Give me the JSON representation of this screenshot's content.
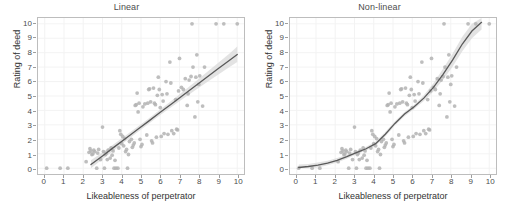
{
  "figure": {
    "background": "#ffffff",
    "point_color": "#b3b3b3",
    "line_color": "#595959",
    "ribbon_color": "#d9d9d9",
    "panel_border_color": "#bdbdbd",
    "grid_color": "#f2f2f2"
  },
  "chart_data": [
    {
      "type": "scatter",
      "title": "Linear",
      "xlabel": "Likeableness of perpetrator",
      "ylabel": "Rating of deed",
      "xlim": [
        -0.35,
        10.35
      ],
      "ylim": [
        -0.4,
        10.4
      ],
      "xticks": [
        0,
        1,
        2,
        3,
        4,
        5,
        6,
        7,
        8,
        9,
        10
      ],
      "yticks": [
        0,
        1,
        2,
        3,
        4,
        5,
        6,
        7,
        8,
        9,
        10
      ],
      "grid": true,
      "legend": "none",
      "fit": {
        "kind": "linear",
        "label": "linear regression with 95% confidence band",
        "x": [
          2.4,
          3.0,
          3.6,
          4.2,
          4.8,
          5.4,
          6.0,
          6.6,
          7.2,
          7.8,
          8.4,
          9.0,
          9.6,
          10.0
        ],
        "y": [
          0.25,
          0.85,
          1.46,
          2.06,
          2.66,
          3.26,
          3.87,
          4.47,
          5.07,
          5.67,
          6.28,
          6.88,
          7.48,
          7.88
        ],
        "ci_lower": [
          0.0,
          0.62,
          1.25,
          1.86,
          2.47,
          3.08,
          3.68,
          4.26,
          4.82,
          5.38,
          5.93,
          6.47,
          7.0,
          7.35
        ],
        "ci_upper": [
          0.55,
          1.1,
          1.68,
          2.27,
          2.86,
          3.45,
          4.06,
          4.69,
          5.33,
          5.97,
          6.62,
          7.28,
          7.95,
          8.42
        ]
      },
      "points": [
        [
          0.1,
          0
        ],
        [
          0.8,
          0
        ],
        [
          1.2,
          0
        ],
        [
          2.15,
          0.45
        ],
        [
          2.3,
          1.1
        ],
        [
          2.35,
          1.35
        ],
        [
          2.4,
          1.2
        ],
        [
          2.45,
          0.95
        ],
        [
          2.5,
          1.0
        ],
        [
          2.55,
          1.25
        ],
        [
          2.6,
          1.15
        ],
        [
          2.7,
          0
        ],
        [
          2.75,
          1.05
        ],
        [
          2.8,
          1.3
        ],
        [
          2.9,
          0.6
        ],
        [
          3.0,
          2.85
        ],
        [
          3.05,
          1.15
        ],
        [
          3.1,
          0
        ],
        [
          3.15,
          0.95
        ],
        [
          3.2,
          1.05
        ],
        [
          3.25,
          0.6
        ],
        [
          3.3,
          1.25
        ],
        [
          3.4,
          0.7
        ],
        [
          3.45,
          1.4
        ],
        [
          3.5,
          0.9
        ],
        [
          3.55,
          1.2
        ],
        [
          3.6,
          0
        ],
        [
          3.65,
          0.55
        ],
        [
          3.7,
          0
        ],
        [
          3.8,
          0
        ],
        [
          3.85,
          1.4
        ],
        [
          3.9,
          2.6
        ],
        [
          3.95,
          2.35
        ],
        [
          4.0,
          1.7
        ],
        [
          4.05,
          2.2
        ],
        [
          4.1,
          1.55
        ],
        [
          4.15,
          2.05
        ],
        [
          4.2,
          1.15
        ],
        [
          4.25,
          1.3
        ],
        [
          4.3,
          0
        ],
        [
          4.35,
          0.95
        ],
        [
          4.4,
          1.85
        ],
        [
          4.5,
          2.0
        ],
        [
          4.55,
          1.45
        ],
        [
          4.6,
          1.6
        ],
        [
          4.65,
          1.75
        ],
        [
          4.7,
          4.35
        ],
        [
          4.75,
          4.4
        ],
        [
          4.8,
          5.2
        ],
        [
          4.85,
          3.9
        ],
        [
          4.9,
          4.5
        ],
        [
          4.95,
          2.0
        ],
        [
          5.0,
          1.5
        ],
        [
          5.05,
          1.65
        ],
        [
          5.1,
          4.25
        ],
        [
          5.2,
          4.45
        ],
        [
          5.3,
          2.3
        ],
        [
          5.35,
          4.5
        ],
        [
          5.4,
          5.45
        ],
        [
          5.45,
          5.5
        ],
        [
          5.5,
          4.6
        ],
        [
          5.55,
          1.9
        ],
        [
          5.6,
          1.75
        ],
        [
          5.65,
          5.55
        ],
        [
          5.7,
          4.5
        ],
        [
          5.75,
          4.4
        ],
        [
          5.8,
          2.15
        ],
        [
          5.85,
          5.05
        ],
        [
          5.9,
          6.3
        ],
        [
          5.95,
          5.45
        ],
        [
          6.0,
          4.2
        ],
        [
          6.05,
          2.2
        ],
        [
          6.1,
          5.1
        ],
        [
          6.15,
          4.65
        ],
        [
          6.2,
          2.4
        ],
        [
          6.3,
          6.0
        ],
        [
          6.35,
          5.15
        ],
        [
          6.4,
          2.35
        ],
        [
          6.5,
          7.35
        ],
        [
          6.55,
          5.9
        ],
        [
          6.6,
          2.6
        ],
        [
          6.7,
          2.4
        ],
        [
          6.8,
          4.75
        ],
        [
          6.85,
          2.7
        ],
        [
          6.9,
          2.65
        ],
        [
          6.95,
          5.35
        ],
        [
          7.0,
          7.6
        ],
        [
          7.1,
          5.6
        ],
        [
          7.2,
          5.45
        ],
        [
          7.3,
          6.2
        ],
        [
          7.4,
          4.35
        ],
        [
          7.45,
          5.15
        ],
        [
          7.5,
          6.1
        ],
        [
          7.6,
          6.35
        ],
        [
          7.65,
          10
        ],
        [
          7.7,
          7.0
        ],
        [
          7.8,
          3.55
        ],
        [
          7.85,
          6.3
        ],
        [
          7.9,
          7.85
        ],
        [
          7.95,
          4.6
        ],
        [
          8.0,
          5.8
        ],
        [
          8.05,
          6.4
        ],
        [
          8.2,
          4.3
        ],
        [
          8.3,
          7.0
        ],
        [
          8.9,
          10
        ],
        [
          9.3,
          10
        ],
        [
          10.0,
          10
        ]
      ]
    },
    {
      "type": "scatter",
      "title": "Non-linear",
      "xlabel": "Likeableness of perpetrator",
      "ylabel": "Rating of deed",
      "xlim": [
        -0.35,
        10.35
      ],
      "ylim": [
        -0.4,
        10.4
      ],
      "xticks": [
        0,
        1,
        2,
        3,
        4,
        5,
        6,
        7,
        8,
        9,
        10
      ],
      "yticks": [
        0,
        1,
        2,
        3,
        4,
        5,
        6,
        7,
        8,
        9,
        10
      ],
      "grid": true,
      "legend": "none",
      "fit": {
        "kind": "curve",
        "label": "non-linear (polynomial) fit with 95% confidence band",
        "x": [
          0.1,
          0.6,
          1.1,
          1.6,
          2.1,
          2.6,
          3.1,
          3.6,
          4.1,
          4.6,
          5.1,
          5.6,
          6.1,
          6.6,
          7.1,
          7.6,
          8.1,
          8.6,
          9.1,
          9.6
        ],
        "y": [
          0.05,
          0.12,
          0.22,
          0.36,
          0.55,
          0.8,
          1.08,
          1.35,
          1.7,
          2.35,
          3.1,
          3.75,
          4.25,
          4.85,
          5.6,
          6.5,
          7.5,
          8.6,
          9.5,
          10.1
        ],
        "ci_lower": [
          0.0,
          0.0,
          0.05,
          0.2,
          0.4,
          0.66,
          0.96,
          1.22,
          1.55,
          2.2,
          2.95,
          3.6,
          4.1,
          4.65,
          5.32,
          6.12,
          7.05,
          8.1,
          9.0,
          9.6
        ],
        "ci_upper": [
          0.25,
          0.3,
          0.4,
          0.52,
          0.7,
          0.94,
          1.2,
          1.48,
          1.85,
          2.5,
          3.25,
          3.9,
          4.4,
          5.05,
          5.88,
          6.88,
          7.95,
          9.1,
          10.0,
          10.4
        ]
      },
      "points": [
        [
          0.1,
          0
        ],
        [
          0.8,
          0
        ],
        [
          1.2,
          0
        ],
        [
          2.15,
          0.45
        ],
        [
          2.3,
          1.1
        ],
        [
          2.35,
          1.35
        ],
        [
          2.4,
          1.2
        ],
        [
          2.45,
          0.95
        ],
        [
          2.5,
          1.0
        ],
        [
          2.55,
          1.25
        ],
        [
          2.6,
          1.15
        ],
        [
          2.7,
          0
        ],
        [
          2.75,
          1.05
        ],
        [
          2.8,
          1.3
        ],
        [
          2.9,
          0.6
        ],
        [
          3.0,
          2.85
        ],
        [
          3.05,
          1.15
        ],
        [
          3.1,
          0
        ],
        [
          3.15,
          0.95
        ],
        [
          3.2,
          1.05
        ],
        [
          3.25,
          0.6
        ],
        [
          3.3,
          1.25
        ],
        [
          3.4,
          0.7
        ],
        [
          3.45,
          1.4
        ],
        [
          3.5,
          0.9
        ],
        [
          3.55,
          1.2
        ],
        [
          3.6,
          0
        ],
        [
          3.65,
          0.55
        ],
        [
          3.7,
          0
        ],
        [
          3.8,
          0
        ],
        [
          3.85,
          1.4
        ],
        [
          3.9,
          2.6
        ],
        [
          3.95,
          2.35
        ],
        [
          4.0,
          1.7
        ],
        [
          4.05,
          2.2
        ],
        [
          4.1,
          1.55
        ],
        [
          4.15,
          2.05
        ],
        [
          4.2,
          1.15
        ],
        [
          4.25,
          1.3
        ],
        [
          4.3,
          0
        ],
        [
          4.35,
          0.95
        ],
        [
          4.4,
          1.85
        ],
        [
          4.5,
          2.0
        ],
        [
          4.55,
          1.45
        ],
        [
          4.6,
          1.6
        ],
        [
          4.65,
          1.75
        ],
        [
          4.7,
          4.35
        ],
        [
          4.75,
          4.4
        ],
        [
          4.8,
          5.2
        ],
        [
          4.85,
          3.9
        ],
        [
          4.9,
          4.5
        ],
        [
          4.95,
          2.0
        ],
        [
          5.0,
          1.5
        ],
        [
          5.05,
          1.65
        ],
        [
          5.1,
          4.25
        ],
        [
          5.2,
          4.45
        ],
        [
          5.3,
          2.3
        ],
        [
          5.35,
          4.5
        ],
        [
          5.4,
          5.45
        ],
        [
          5.45,
          5.5
        ],
        [
          5.5,
          4.6
        ],
        [
          5.55,
          1.9
        ],
        [
          5.6,
          1.75
        ],
        [
          5.65,
          5.55
        ],
        [
          5.7,
          4.5
        ],
        [
          5.75,
          4.4
        ],
        [
          5.8,
          2.15
        ],
        [
          5.85,
          5.05
        ],
        [
          5.9,
          6.3
        ],
        [
          5.95,
          5.45
        ],
        [
          6.0,
          4.2
        ],
        [
          6.05,
          2.2
        ],
        [
          6.1,
          5.1
        ],
        [
          6.15,
          4.65
        ],
        [
          6.2,
          2.4
        ],
        [
          6.3,
          6.0
        ],
        [
          6.35,
          5.15
        ],
        [
          6.4,
          2.35
        ],
        [
          6.5,
          7.35
        ],
        [
          6.55,
          5.9
        ],
        [
          6.6,
          2.6
        ],
        [
          6.7,
          2.4
        ],
        [
          6.8,
          4.75
        ],
        [
          6.85,
          2.7
        ],
        [
          6.9,
          2.65
        ],
        [
          6.95,
          5.35
        ],
        [
          7.0,
          7.6
        ],
        [
          7.1,
          5.6
        ],
        [
          7.2,
          5.45
        ],
        [
          7.3,
          6.2
        ],
        [
          7.4,
          4.35
        ],
        [
          7.45,
          5.15
        ],
        [
          7.5,
          6.1
        ],
        [
          7.6,
          6.35
        ],
        [
          7.65,
          10
        ],
        [
          7.7,
          7.0
        ],
        [
          7.8,
          3.55
        ],
        [
          7.85,
          6.3
        ],
        [
          7.9,
          7.85
        ],
        [
          7.95,
          4.6
        ],
        [
          8.0,
          5.8
        ],
        [
          8.05,
          6.4
        ],
        [
          8.2,
          4.3
        ],
        [
          8.3,
          7.0
        ],
        [
          8.9,
          10
        ],
        [
          9.3,
          10
        ],
        [
          10.0,
          10
        ]
      ]
    }
  ]
}
